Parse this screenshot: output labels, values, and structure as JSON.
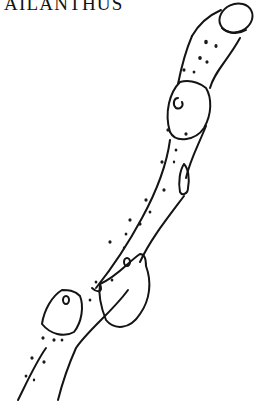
{
  "illustration": {
    "title": "AILANTHUS",
    "subject": "twig line drawing",
    "footer_label": "",
    "colors": {
      "ink": "#141414",
      "background": "#ffffff"
    }
  }
}
